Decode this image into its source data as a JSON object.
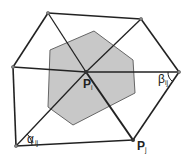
{
  "diagram": {
    "labels": {
      "center_point": "P",
      "center_point_sub": "i",
      "bottom_point": "P",
      "bottom_point_sub": "j",
      "alpha_angle": "α",
      "alpha_angle_sub": "ij",
      "beta_angle": "β",
      "beta_angle_sub": "ij"
    },
    "colors": {
      "cell_fill": "#c8c8c8",
      "cell_stroke": "#555555",
      "edge": "#222222",
      "background": "#ffffff"
    }
  }
}
